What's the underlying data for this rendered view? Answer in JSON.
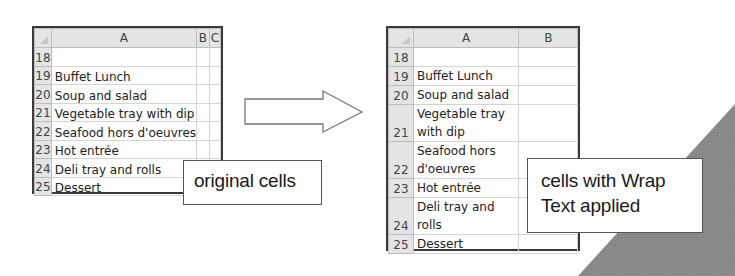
{
  "figure": {
    "original": {
      "columns": [
        "A",
        "B",
        "C"
      ],
      "rows": [
        {
          "num": "18",
          "a": ""
        },
        {
          "num": "19",
          "a": "Buffet Lunch"
        },
        {
          "num": "20",
          "a": "Soup and salad"
        },
        {
          "num": "21",
          "a": "Vegetable tray with dip"
        },
        {
          "num": "22",
          "a": "Seafood hors d'oeuvres"
        },
        {
          "num": "23",
          "a": "Hot entrée"
        },
        {
          "num": "24",
          "a": "Deli tray and rolls"
        },
        {
          "num": "25",
          "a": "Dessert"
        }
      ],
      "callout": "original cells"
    },
    "wrapped": {
      "columns": [
        "A",
        "B"
      ],
      "rows": [
        {
          "num": "18",
          "a": ""
        },
        {
          "num": "19",
          "a": "Buffet Lunch"
        },
        {
          "num": "20",
          "a": "Soup and salad"
        },
        {
          "num": "21",
          "a": "Vegetable tray with dip"
        },
        {
          "num": "22",
          "a": "Seafood hors d'oeuvres"
        },
        {
          "num": "23",
          "a": "Hot entrée"
        },
        {
          "num": "24",
          "a": "Deli tray and rolls"
        },
        {
          "num": "25",
          "a": "Dessert"
        }
      ],
      "callout_line1": "cells with Wrap",
      "callout_line2": "Text applied"
    },
    "colors": {
      "header_bg": "#e4e4e4",
      "corner_triangle": "#8a8a8a",
      "border": "#3a3a3a"
    }
  }
}
